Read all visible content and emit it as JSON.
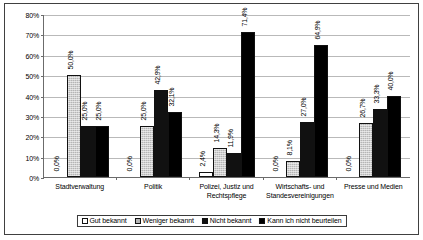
{
  "chart_data": {
    "type": "bar",
    "title": "",
    "xlabel": "",
    "ylabel": "",
    "ylim": [
      0,
      80
    ],
    "ytick_step": 10,
    "grid": true,
    "legend_position": "bottom",
    "categories": [
      "Stadtverwaltung",
      "Politik",
      "Polizei, Justiz und Rechtspflege",
      "Wirtschafts- und Standesvereinigungen",
      "Presse und Medien"
    ],
    "ytick_labels": [
      "80%",
      "70%",
      "60%",
      "50%",
      "40%",
      "30%",
      "20%",
      "10%",
      "0%"
    ],
    "ytick_values": [
      80,
      70,
      60,
      50,
      40,
      30,
      20,
      10,
      0
    ],
    "series": [
      {
        "name": "Gut bekannt",
        "color": "#ffffff",
        "values": [
          0.0,
          0.0,
          2.4,
          0.0,
          0.0
        ],
        "labels": [
          "0,0%",
          "0,0%",
          "2,4%",
          "0,0%",
          "0,0%"
        ]
      },
      {
        "name": "Weniger bekannt",
        "color": "#b5b5b5",
        "values": [
          50.0,
          25.0,
          14.3,
          8.1,
          26.7
        ],
        "labels": [
          "50,0%",
          "25,0%",
          "14,3%",
          "8,1%",
          "26,7%"
        ]
      },
      {
        "name": "Nicht bekannt",
        "color": "#111111",
        "values": [
          25.0,
          42.9,
          11.9,
          27.0,
          33.3
        ],
        "labels": [
          "25,0%",
          "42,9%",
          "11,9%",
          "27,0%",
          "33,3%"
        ]
      },
      {
        "name": "Kann ich nicht beurteilen",
        "color": "#000000",
        "values": [
          25.0,
          32.1,
          71.4,
          64.9,
          40.0
        ],
        "labels": [
          "25,0%",
          "32,1%",
          "71,4%",
          "64,9%",
          "40,0%"
        ]
      }
    ]
  }
}
